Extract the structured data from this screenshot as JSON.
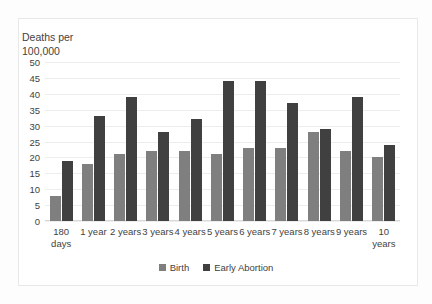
{
  "chart_data": {
    "type": "bar",
    "title": "",
    "ylabel": "Deaths per\n100,000",
    "xlabel": "",
    "ylim": [
      0,
      50
    ],
    "yticks": [
      0,
      5,
      10,
      15,
      20,
      25,
      30,
      35,
      40,
      45,
      50
    ],
    "grid": true,
    "legend_position": "bottom",
    "categories": [
      "180 days",
      "1 year",
      "2 years",
      "3 years",
      "4 years",
      "5 years",
      "6 years",
      "7 years",
      "8 years",
      "9 years",
      "10 years"
    ],
    "series": [
      {
        "name": "Birth",
        "color": "#7f7f7f",
        "values": [
          8,
          18,
          21,
          22,
          22,
          21,
          23,
          23,
          28,
          22,
          20
        ]
      },
      {
        "name": "Early Abortion",
        "color": "#404040",
        "values": [
          19,
          33,
          39,
          28,
          32,
          44,
          44,
          37,
          29,
          39,
          24
        ]
      }
    ]
  },
  "legend": {
    "items": [
      {
        "label": "Birth",
        "color": "#7f7f7f"
      },
      {
        "label": "Early Abortion",
        "color": "#404040"
      }
    ]
  }
}
